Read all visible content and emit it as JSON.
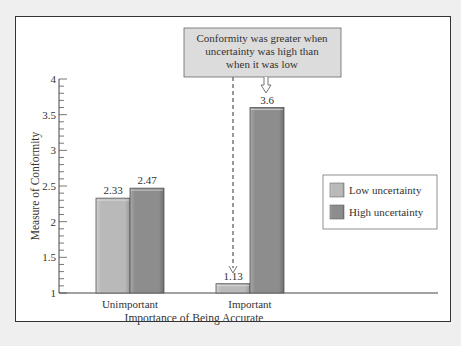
{
  "chart_data": {
    "type": "bar",
    "title": "",
    "xlabel": "Importance of Being Accurate",
    "ylabel": "Measure of Conformity",
    "categories": [
      "Unimportant",
      "Important"
    ],
    "series": [
      {
        "name": "Low uncertainty",
        "values": [
          2.33,
          1.13
        ],
        "color": "#b9b9b9"
      },
      {
        "name": "High uncertainty",
        "values": [
          2.47,
          3.6
        ],
        "color": "#8d8d8d"
      }
    ],
    "value_labels": [
      "2.33",
      "2.47",
      "1.13",
      "3.6"
    ],
    "ylim": [
      1,
      4
    ],
    "yticks": [
      "1",
      "1.5",
      "2",
      "2.5",
      "3",
      "3.5",
      "4"
    ],
    "minor_tick_step": 0.1,
    "grid": false,
    "legend_position": "right",
    "annotation": {
      "lines": [
        "Conformity was greater when",
        "uncertainty was high than",
        "when it was low"
      ],
      "box_color": "#dcdcdc"
    }
  }
}
